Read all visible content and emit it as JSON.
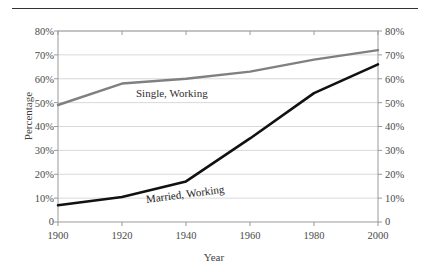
{
  "chart_data": {
    "type": "line",
    "title": "",
    "xlabel": "Year",
    "ylabel": "Percentage",
    "ylabel_right": "Percentage",
    "x": [
      1900,
      1920,
      1940,
      1960,
      1980,
      2000
    ],
    "xlim": [
      1900,
      2000
    ],
    "ylim": [
      0,
      80
    ],
    "xticks": [
      "1900",
      "1920",
      "1940",
      "1960",
      "1980",
      "2000"
    ],
    "yticks": [
      "0",
      "10%",
      "20%",
      "30%",
      "40%",
      "50%",
      "60%",
      "70%",
      "80%"
    ],
    "ytick_values": [
      0,
      10,
      20,
      30,
      40,
      50,
      60,
      70,
      80
    ],
    "yticks_right": [
      "0",
      "10%",
      "20%",
      "30%",
      "40%",
      "50%",
      "60%",
      "70%",
      "80%"
    ],
    "grid": "horizontal",
    "legend_position": "inline-annotation",
    "series": [
      {
        "name": "Single, Working",
        "color": "#808080",
        "values": [
          49,
          58,
          60,
          63,
          68,
          72
        ]
      },
      {
        "name": "Married, Working",
        "color": "#111111",
        "values": [
          7,
          10.5,
          17,
          35,
          54,
          66
        ]
      }
    ]
  },
  "annotations": {
    "single_label": "Single, Working",
    "married_label": "Married, Working"
  },
  "axis_titles": {
    "x": "Year",
    "y": "Percentage"
  },
  "colors": {
    "single_series": "#808080",
    "married_series": "#111111",
    "gridline": "#d9d9d9",
    "axis_frame": "#9a9a9a",
    "top_rule": "#333333",
    "tick_text": "#4a4a4a",
    "background": "#ffffff"
  }
}
